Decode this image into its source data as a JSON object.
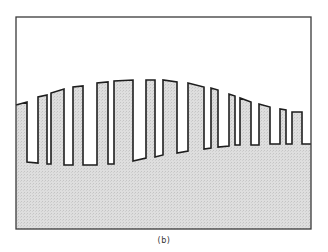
{
  "figure": {
    "caption": "(b)",
    "frame": {
      "x1": 16,
      "y1": 17,
      "x2": 311,
      "y2": 229
    },
    "colors": {
      "frame": "#3a3a3a",
      "waveform": "#1e1e1e",
      "fill": "#dedede",
      "fill_dot": "#c4c4c4",
      "background": "#ffffff"
    },
    "waveform": {
      "description": "Pulse train whose top envelope follows a broad hump and whose bottom baseline slowly rises left to right; area below waveform shaded",
      "points": [
        [
          16,
          105
        ],
        [
          27,
          102
        ],
        [
          27,
          162
        ],
        [
          38,
          163
        ],
        [
          38,
          97
        ],
        [
          47,
          95
        ],
        [
          47,
          164
        ],
        [
          51,
          164
        ],
        [
          51,
          93
        ],
        [
          64,
          89
        ],
        [
          64,
          165
        ],
        [
          73,
          165
        ],
        [
          73,
          87
        ],
        [
          83,
          86
        ],
        [
          83,
          165
        ],
        [
          97,
          165
        ],
        [
          97,
          83
        ],
        [
          108,
          82
        ],
        [
          108,
          164
        ],
        [
          114,
          164
        ],
        [
          114,
          81
        ],
        [
          133,
          80
        ],
        [
          133,
          161
        ],
        [
          146,
          158
        ],
        [
          146,
          80
        ],
        [
          155,
          80
        ],
        [
          155,
          157
        ],
        [
          163,
          155
        ],
        [
          163,
          80
        ],
        [
          177,
          82
        ],
        [
          177,
          153
        ],
        [
          188,
          151
        ],
        [
          188,
          83
        ],
        [
          204,
          87
        ],
        [
          204,
          149
        ],
        [
          211,
          148
        ],
        [
          211,
          88
        ],
        [
          218,
          90
        ],
        [
          218,
          147
        ],
        [
          229,
          146
        ],
        [
          229,
          94
        ],
        [
          235,
          96
        ],
        [
          235,
          145
        ],
        [
          240,
          145
        ],
        [
          240,
          98
        ],
        [
          251,
          102
        ],
        [
          251,
          145
        ],
        [
          259,
          145
        ],
        [
          259,
          104
        ],
        [
          270,
          107
        ],
        [
          270,
          144
        ],
        [
          280,
          144
        ],
        [
          280,
          109
        ],
        [
          286,
          110
        ],
        [
          286,
          144
        ],
        [
          292,
          144
        ],
        [
          292,
          112
        ],
        [
          302,
          112
        ],
        [
          302,
          144
        ],
        [
          311,
          144
        ]
      ]
    }
  }
}
